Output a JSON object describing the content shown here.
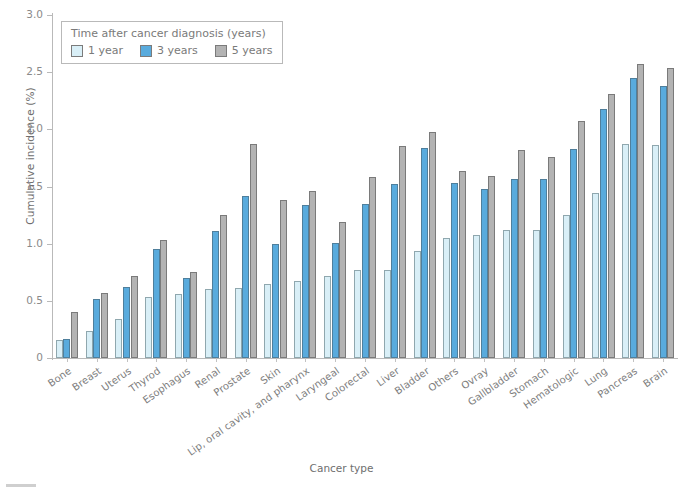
{
  "chart_data": {
    "type": "bar",
    "title": "",
    "xlabel": "Cancer type",
    "ylabel": "Cumulative incidence (%)",
    "ylim": [
      0,
      3.0
    ],
    "yticks": [
      "0",
      "0.5",
      "1.0",
      "1.5",
      "2.0",
      "2.5",
      "3.0"
    ],
    "ytick_values": [
      0,
      0.5,
      1.0,
      1.5,
      2.0,
      2.5,
      3.0
    ],
    "grid": false,
    "legend_position": "upper left",
    "legend_title": "Time after cancer diagnosis (years)",
    "categories": [
      "Bone",
      "Breast",
      "Uterus",
      "Thyrod",
      "Esophagus",
      "Renal",
      "Prostate",
      "Skin",
      "Lip, oral cavity, and pharynx",
      "Laryngeal",
      "Colorectal",
      "Liver",
      "Bladder",
      "Others",
      "Ovray",
      "Gallbladder",
      "Stomach",
      "Hematologic",
      "Lung",
      "Pancreas",
      "Brain"
    ],
    "series": [
      {
        "name": "1 year",
        "color": "#d9eff7",
        "values": [
          0.16,
          0.24,
          0.34,
          0.53,
          0.56,
          0.6,
          0.61,
          0.65,
          0.67,
          0.72,
          0.77,
          0.77,
          0.94,
          1.05,
          1.08,
          1.12,
          1.12,
          1.25,
          1.44,
          1.87,
          1.86
        ]
      },
      {
        "name": "3 years",
        "color": "#59abdd",
        "values": [
          0.17,
          0.52,
          0.62,
          0.95,
          0.7,
          1.11,
          1.42,
          1.0,
          1.34,
          1.01,
          1.35,
          1.52,
          1.84,
          1.53,
          1.48,
          1.57,
          1.57,
          1.83,
          2.18,
          2.45,
          2.38
        ]
      },
      {
        "name": "5 years",
        "color": "#b3b3b3",
        "values": [
          0.4,
          0.57,
          0.72,
          1.03,
          0.75,
          1.25,
          1.87,
          1.38,
          1.46,
          1.19,
          1.58,
          1.85,
          1.98,
          1.64,
          1.59,
          1.82,
          1.76,
          2.07,
          2.31,
          2.57,
          2.54
        ]
      }
    ]
  },
  "legend": {
    "title": "Time after cancer diagnosis (years)",
    "items": [
      {
        "label": "1 year",
        "color": "#d9eff7"
      },
      {
        "label": "3 years",
        "color": "#59abdd"
      },
      {
        "label": "5 years",
        "color": "#b3b3b3"
      }
    ]
  },
  "axes": {
    "y_title": "Cumulative incidence (%)",
    "x_title": "Cancer type"
  }
}
